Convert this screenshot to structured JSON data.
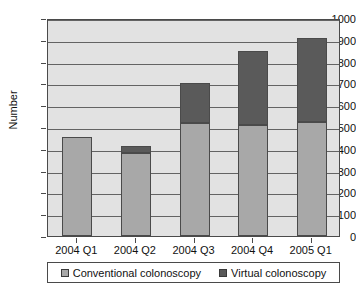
{
  "chart_data": {
    "type": "bar",
    "subtype": "stacked-vertical",
    "title": "",
    "xlabel": "",
    "ylabel": "Number",
    "ylim": [
      0,
      1000
    ],
    "ytick_step": 100,
    "yticks": [
      0,
      100,
      200,
      300,
      400,
      500,
      600,
      700,
      800,
      900,
      1000
    ],
    "ytick_labels": [
      "0",
      "100",
      "200",
      "300",
      "400",
      "500",
      "600",
      "700",
      "800",
      "900",
      "1000"
    ],
    "grid": true,
    "grid_axis": "y",
    "legend_position": "bottom",
    "categories": [
      "2004 Q1",
      "2004 Q2",
      "2004 Q3",
      "2004 Q4",
      "2005 Q1"
    ],
    "series": [
      {
        "name": "Conventional colonoscopy",
        "color": "#a8a8a8",
        "values": [
          455,
          380,
          520,
          510,
          525
        ]
      },
      {
        "name": "Virtual colonoscopy",
        "color": "#5a5a5a",
        "values": [
          0,
          35,
          180,
          340,
          385
        ]
      }
    ],
    "totals": [
      455,
      415,
      700,
      850,
      910
    ]
  },
  "axis": {
    "y_title": "Number"
  },
  "legend": {
    "items": [
      {
        "label": "Conventional colonoscopy",
        "color": "#a8a8a8"
      },
      {
        "label": "Virtual colonoscopy",
        "color": "#5a5a5a"
      }
    ]
  },
  "colors": {
    "plot_background": "#e2e2e2",
    "gridline": "#636363",
    "axis": "#4a4a4a",
    "text": "#111111",
    "page_background": "#ffffff"
  }
}
